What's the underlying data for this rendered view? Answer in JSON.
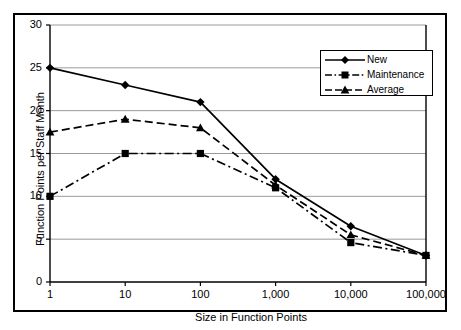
{
  "chart_data": {
    "type": "line",
    "title": "",
    "xlabel": "Size in Function Points",
    "ylabel": "Function Points per Staff Month",
    "x_scale": "log",
    "x": [
      1,
      10,
      100,
      1000,
      10000,
      100000
    ],
    "categories": [
      "1",
      "10",
      "100",
      "1,000",
      "10,000",
      "100,000"
    ],
    "xticklabels": [
      "1",
      "10",
      "100",
      "1,000",
      "10,000",
      "100,000"
    ],
    "yticklabels": [
      "0",
      "5",
      "10",
      "15",
      "20",
      "25",
      "30"
    ],
    "yticks": [
      0,
      5,
      10,
      15,
      20,
      25,
      30
    ],
    "ylim": [
      0,
      30
    ],
    "grid": "horizontal",
    "legend_position": "top-right",
    "series": [
      {
        "name": "New",
        "values": [
          25,
          23,
          21,
          12,
          6.5,
          3.1
        ],
        "marker": "diamond",
        "linestyle": "solid",
        "color": "#000000"
      },
      {
        "name": "Maintenance",
        "values": [
          10,
          15,
          15,
          11,
          4.6,
          3.1
        ],
        "marker": "square",
        "linestyle": "dashdot",
        "color": "#000000"
      },
      {
        "name": "Average",
        "values": [
          17.5,
          19,
          18,
          11.3,
          5.5,
          3.1
        ],
        "marker": "triangle",
        "linestyle": "dashed",
        "color": "#000000"
      }
    ]
  },
  "legend": {
    "items": [
      {
        "label": "New"
      },
      {
        "label": "Maintenance"
      },
      {
        "label": "Average"
      }
    ]
  },
  "colors": {
    "ink": "#000000",
    "gridline": "#9a9a9a",
    "background": "#ffffff"
  }
}
